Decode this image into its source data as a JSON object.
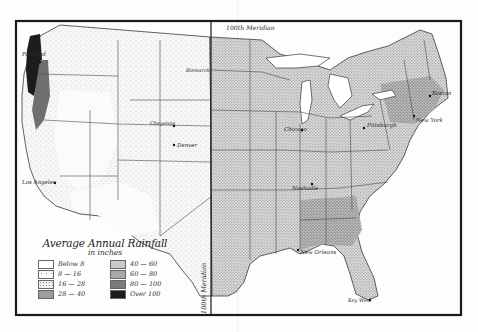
{
  "map": {
    "title": "Average Annual Rainfall",
    "subtitle": "in inches",
    "meridian_label_top": "100th Meridian",
    "meridian_label_bottom": "100th Meridian",
    "cities": [
      {
        "name": "Portland",
        "x": 22,
        "y": 55
      },
      {
        "name": "Los Angeles",
        "x": 22,
        "y": 183
      },
      {
        "name": "Denver",
        "x": 176,
        "y": 144
      },
      {
        "name": "Cheyenne",
        "x": 160,
        "y": 126
      },
      {
        "name": "Bismarck",
        "x": 187,
        "y": 71
      },
      {
        "name": "Chicago",
        "x": 284,
        "y": 131
      },
      {
        "name": "Pittsburgh",
        "x": 368,
        "y": 127
      },
      {
        "name": "Boston",
        "x": 432,
        "y": 95
      },
      {
        "name": "New York",
        "x": 417,
        "y": 121
      },
      {
        "name": "Nashville",
        "x": 296,
        "y": 188
      },
      {
        "name": "New Orleans",
        "x": 300,
        "y": 253
      },
      {
        "name": "Key West",
        "x": 349,
        "y": 300
      }
    ]
  },
  "legend": {
    "items": [
      {
        "label": "Below 8",
        "color": "#ffffff",
        "pattern": "none"
      },
      {
        "label": "8 — 16",
        "color": "#f8f8f8",
        "pattern": "sparse"
      },
      {
        "label": "16 — 28",
        "color": "#efefef",
        "pattern": "dots"
      },
      {
        "label": "28 — 40",
        "color": "#e4e4e4",
        "pattern": "dense"
      },
      {
        "label": "40 — 60",
        "color": "#c9c9c9",
        "pattern": "fine"
      },
      {
        "label": "60 — 80",
        "color": "#a8a8a8",
        "pattern": "fine"
      },
      {
        "label": "80 — 100",
        "color": "#7a7a7a",
        "pattern": "fine"
      },
      {
        "label": "Over 100",
        "color": "#1c1c1c",
        "pattern": "solid"
      }
    ]
  },
  "colors": {
    "frame": "#1a1a1a",
    "border_lines": "#3a3a3a",
    "land_east": "#d6d6d6",
    "land_west": "#f3f3f3",
    "water": "#ffffff"
  }
}
